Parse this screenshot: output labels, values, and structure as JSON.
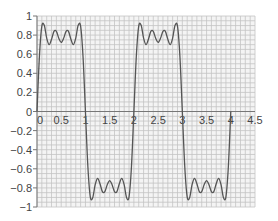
{
  "chart_data": {
    "type": "line",
    "title": "",
    "xlabel": "",
    "ylabel": "",
    "xlim": [
      0,
      4.5
    ],
    "ylim": [
      -1,
      1
    ],
    "grid": true,
    "grid_minor_x_step": 0.1,
    "grid_minor_y_step": 0.05,
    "legend": null,
    "x_ticks": [
      0,
      0.5,
      1,
      1.5,
      2,
      2.5,
      3,
      3.5,
      4,
      4.5
    ],
    "x_tick_labels": [
      "0",
      "0.5",
      "1",
      "1.5",
      "2",
      "2.5",
      "3",
      "3.5",
      "4",
      "4.5"
    ],
    "y_ticks": [
      1,
      0.8,
      0.6,
      0.4,
      0.2,
      0,
      -0.2,
      -0.4,
      -0.6,
      -0.8,
      -1
    ],
    "y_tick_labels": [
      "1",
      "0.8",
      "0.6",
      "0.4",
      "0.2",
      "0",
      "−0.2",
      "−0.4",
      "−0.6",
      "−0.8",
      "−1"
    ],
    "series": [
      {
        "name": "square-wave-fourier-approximation",
        "color": "#555555",
        "x_step": 0.05,
        "x_start": 0,
        "half_period_values": [
          0,
          0.576,
          0.893,
          0.902,
          0.769,
          0.7,
          0.756,
          0.839,
          0.839,
          0.767,
          0.724,
          0.767,
          0.839,
          0.839,
          0.756,
          0.7,
          0.769,
          0.902,
          0.893,
          0.576,
          0
        ],
        "x_end": 4.0
      }
    ]
  },
  "colors": {
    "background": "#ffffff",
    "plot_background": "#f4f4f4",
    "grid": "#c4c4c4",
    "axis": "#777777",
    "curve": "#555555"
  }
}
